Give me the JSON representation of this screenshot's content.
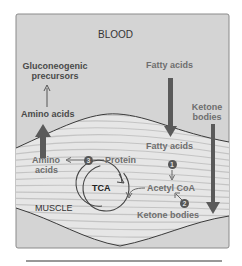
{
  "diagram": {
    "regions": {
      "blood": "BLOOD",
      "muscle": "MUSCLE"
    },
    "labels": {
      "gluconeogenic_precursors_line1": "Gluconeogenic",
      "gluconeogenic_precursors_line2": "precursors",
      "amino_acids_blood": "Amino acids",
      "fatty_acids_blood": "Fatty acids",
      "ketone_bodies_blood_line1": "Ketone",
      "ketone_bodies_blood_line2": "bodies",
      "fatty_acids_muscle": "Fatty acids",
      "amino_acids_muscle_line1": "Amino",
      "amino_acids_muscle_line2": "acids",
      "protein": "Protein",
      "tca": "TCA",
      "acetyl_coa": "Acetyl CoA",
      "ketone_bodies_muscle": "Ketone bodies"
    },
    "steps": {
      "step1": "1",
      "step2": "2",
      "step3": "3"
    },
    "colors": {
      "background": "#d4d4d4",
      "muscle_stripes": "#e8e8e8",
      "dark_text": "#4a4a4a",
      "arrow": "#5a5a5a",
      "outline": "#7a7a7a"
    }
  }
}
